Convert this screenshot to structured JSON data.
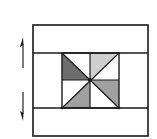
{
  "diagram": {
    "colors": {
      "stroke": "#1a1a1a",
      "background": "#ffffff",
      "dark_gray": "#6e6e6e",
      "medium_gray": "#a0a0a0",
      "light_gray": "#cfcfcf"
    },
    "outer_rect": {
      "x": 33,
      "y": 25,
      "width": 115,
      "height": 111
    },
    "top_band_divider_y": 53,
    "bottom_band_divider_y": 108,
    "inner_square": {
      "x": 62,
      "y": 53,
      "width": 57,
      "height": 55
    },
    "center": {
      "x": 90,
      "y": 80
    },
    "arrows": [
      {
        "name": "up-arrow",
        "direction": "up",
        "x": 23,
        "y1": 68,
        "y2": 38
      },
      {
        "name": "down-arrow",
        "direction": "down",
        "x": 23,
        "y1": 92,
        "y2": 120
      }
    ],
    "shaded_triangles": [
      {
        "quadrant": "top-left",
        "shade": "dark_gray"
      },
      {
        "quadrant": "top-right",
        "shade": "light_gray"
      },
      {
        "quadrant": "bottom-left",
        "shade": "medium_gray"
      },
      {
        "quadrant": "bottom-right",
        "shade": "medium_gray"
      }
    ]
  }
}
